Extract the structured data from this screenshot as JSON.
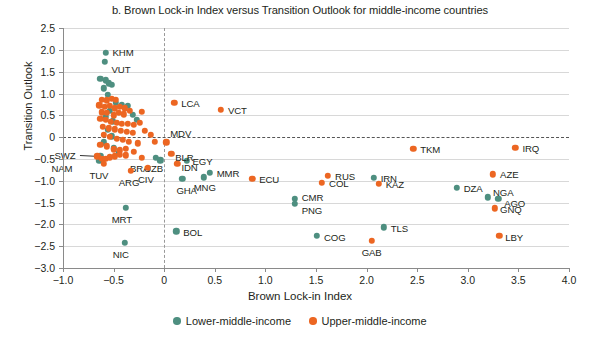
{
  "chart_data": {
    "type": "scatter",
    "title": "b. Brown Lock-in Index versus Transition Outlook for middle-income countries",
    "xlabel": "Brown Lock-in Index",
    "ylabel": "Transition Outlook",
    "xlim": [
      -1.0,
      4.0
    ],
    "ylim": [
      -3.0,
      2.5
    ],
    "xticks": [
      "-1.0",
      "-0.5",
      "0",
      "0.5",
      "1.0",
      "1.5",
      "2.0",
      "2.5",
      "3.0",
      "3.5",
      "4.0"
    ],
    "xtick_values": [
      -1.0,
      -0.5,
      0,
      0.5,
      1.0,
      1.5,
      2.0,
      2.5,
      3.0,
      3.5,
      4.0
    ],
    "yticks": [
      "2.5",
      "2.0",
      "1.5",
      "1.0",
      "0.5",
      "0",
      "-0.5",
      "-1.0",
      "-1.5",
      "-2.0",
      "-2.5",
      "-3.0"
    ],
    "ytick_values": [
      2.5,
      2.0,
      1.5,
      1.0,
      0.5,
      0,
      -0.5,
      -1.0,
      -1.5,
      -2.0,
      -2.5,
      -3.0
    ],
    "grid": "horizontal",
    "reference_lines": [
      {
        "axis": "y",
        "value": 0,
        "style": "dashed"
      },
      {
        "axis": "x",
        "value": 0,
        "style": "dashed"
      }
    ],
    "legend_position": "bottom",
    "colors": {
      "lower_middle_income": "#4e8f80",
      "upper_middle_income": "#ec6622"
    },
    "series": [
      {
        "name": "Lower-middle-income",
        "color": "#4e8f80",
        "points": [
          {
            "label": "KHM",
            "x": -0.58,
            "y": 1.93,
            "label_dx": 7,
            "label_dy": -1
          },
          {
            "label": "VUT",
            "x": -0.59,
            "y": 1.72,
            "label_dx": 7,
            "label_dy": 7
          },
          {
            "label": "",
            "x": -0.63,
            "y": 1.33
          },
          {
            "label": "",
            "x": -0.58,
            "y": 1.3
          },
          {
            "label": "",
            "x": -0.55,
            "y": 1.23
          },
          {
            "label": "",
            "x": -0.52,
            "y": 1.2
          },
          {
            "label": "",
            "x": -0.6,
            "y": 1.12
          },
          {
            "label": "",
            "x": -0.56,
            "y": 0.97
          },
          {
            "label": "",
            "x": -0.48,
            "y": 0.78
          },
          {
            "label": "",
            "x": -0.42,
            "y": 0.74
          },
          {
            "label": "",
            "x": -0.36,
            "y": 0.72
          },
          {
            "label": "",
            "x": -0.54,
            "y": 0.6
          },
          {
            "label": "",
            "x": -0.58,
            "y": 0.46
          },
          {
            "label": "",
            "x": -0.51,
            "y": 0.36
          },
          {
            "label": "",
            "x": -0.31,
            "y": 0.51
          },
          {
            "label": "",
            "x": -0.27,
            "y": 0.4
          },
          {
            "label": "",
            "x": -0.56,
            "y": 0.16
          },
          {
            "label": "",
            "x": -0.52,
            "y": 0.02
          },
          {
            "label": "",
            "x": -0.6,
            "y": -0.12
          },
          {
            "label": "",
            "x": -0.5,
            "y": -0.26
          },
          {
            "label": "",
            "x": -0.45,
            "y": -0.36
          },
          {
            "label": "SWZ",
            "x": -0.63,
            "y": -0.44,
            "label_dx": -46,
            "label_dy": -1,
            "leader": true
          },
          {
            "label": "NAM",
            "x": -0.64,
            "y": -0.55,
            "label_dx": -48,
            "label_dy": 7,
            "leader": false
          },
          {
            "label": "",
            "x": -0.08,
            "y": -0.47
          },
          {
            "label": "UZB",
            "x": -0.04,
            "y": -0.53,
            "label_dx": -16,
            "label_dy": 8
          },
          {
            "label": "EGY",
            "x": 0.22,
            "y": -0.55,
            "label_dx": 6,
            "label_dy": 0
          },
          {
            "label": "MMR",
            "x": 0.45,
            "y": -0.82,
            "label_dx": 7,
            "label_dy": 0
          },
          {
            "label": "MNG",
            "x": 0.39,
            "y": -0.92,
            "label_dx": -10,
            "label_dy": 10
          },
          {
            "label": "GHA",
            "x": 0.18,
            "y": -0.95,
            "label_dx": -6,
            "label_dy": 11
          },
          {
            "label": "CMR",
            "x": 1.29,
            "y": -1.42,
            "label_dx": 7,
            "label_dy": -2
          },
          {
            "label": "PNG",
            "x": 1.29,
            "y": -1.53,
            "label_dx": 7,
            "label_dy": 6
          },
          {
            "label": "IRN",
            "x": 2.07,
            "y": -0.93,
            "label_dx": 7,
            "label_dy": 0
          },
          {
            "label": "DZA",
            "x": 2.89,
            "y": -1.17,
            "label_dx": 7,
            "label_dy": 0
          },
          {
            "label": "NGA",
            "x": 3.2,
            "y": -1.38,
            "label_dx": 5,
            "label_dy": -5
          },
          {
            "label": "AGO",
            "x": 3.3,
            "y": -1.42,
            "label_dx": 6,
            "label_dy": 4
          },
          {
            "label": "MRT",
            "x": -0.38,
            "y": -1.62,
            "label_dx": -14,
            "label_dy": 11
          },
          {
            "label": "NIC",
            "x": -0.39,
            "y": -2.43,
            "label_dx": -12,
            "label_dy": 11
          },
          {
            "label": "BOL",
            "x": 0.12,
            "y": -2.16,
            "label_dx": 7,
            "label_dy": 1
          },
          {
            "label": "COG",
            "x": 1.51,
            "y": -2.27,
            "label_dx": 7,
            "label_dy": 1
          },
          {
            "label": "TLS",
            "x": 2.17,
            "y": -2.07,
            "label_dx": 7,
            "label_dy": 1
          }
        ]
      },
      {
        "name": "Upper-middle-income",
        "color": "#ec6622",
        "points": [
          {
            "label": "",
            "x": -0.62,
            "y": 0.86
          },
          {
            "label": "",
            "x": -0.57,
            "y": 0.84
          },
          {
            "label": "",
            "x": -0.52,
            "y": 0.88
          },
          {
            "label": "",
            "x": -0.48,
            "y": 0.86
          },
          {
            "label": "",
            "x": -0.64,
            "y": 0.73
          },
          {
            "label": "",
            "x": -0.59,
            "y": 0.7
          },
          {
            "label": "",
            "x": -0.54,
            "y": 0.72
          },
          {
            "label": "",
            "x": -0.49,
            "y": 0.66
          },
          {
            "label": "",
            "x": -0.44,
            "y": 0.7
          },
          {
            "label": "",
            "x": -0.39,
            "y": 0.66
          },
          {
            "label": "",
            "x": -0.62,
            "y": 0.57
          },
          {
            "label": "",
            "x": -0.57,
            "y": 0.55
          },
          {
            "label": "",
            "x": -0.5,
            "y": 0.5
          },
          {
            "label": "",
            "x": -0.45,
            "y": 0.55
          },
          {
            "label": "",
            "x": -0.4,
            "y": 0.52
          },
          {
            "label": "",
            "x": -0.34,
            "y": 0.6
          },
          {
            "label": "",
            "x": -0.22,
            "y": 0.58
          },
          {
            "label": "LCA",
            "x": 0.1,
            "y": 0.78,
            "label_dx": 7,
            "label_dy": 0
          },
          {
            "label": "VCT",
            "x": 0.56,
            "y": 0.62,
            "label_dx": 7,
            "label_dy": 0
          },
          {
            "label": "",
            "x": -0.63,
            "y": 0.42
          },
          {
            "label": "",
            "x": -0.58,
            "y": 0.39
          },
          {
            "label": "",
            "x": -0.53,
            "y": 0.35
          },
          {
            "label": "",
            "x": -0.47,
            "y": 0.33
          },
          {
            "label": "",
            "x": -0.42,
            "y": 0.3
          },
          {
            "label": "",
            "x": -0.36,
            "y": 0.3
          },
          {
            "label": "",
            "x": -0.3,
            "y": 0.28
          },
          {
            "label": "",
            "x": -0.24,
            "y": 0.32
          },
          {
            "label": "",
            "x": -0.61,
            "y": 0.23
          },
          {
            "label": "",
            "x": -0.55,
            "y": 0.2
          },
          {
            "label": "",
            "x": -0.49,
            "y": 0.18
          },
          {
            "label": "",
            "x": -0.43,
            "y": 0.14
          },
          {
            "label": "",
            "x": -0.37,
            "y": 0.12
          },
          {
            "label": "",
            "x": -0.31,
            "y": 0.1
          },
          {
            "label": "",
            "x": -0.19,
            "y": 0.14
          },
          {
            "label": "",
            "x": -0.13,
            "y": 0.05
          },
          {
            "label": "",
            "x": -0.6,
            "y": 0.05
          },
          {
            "label": "",
            "x": -0.54,
            "y": 0.0
          },
          {
            "label": "",
            "x": -0.47,
            "y": -0.04
          },
          {
            "label": "",
            "x": -0.41,
            "y": -0.06
          },
          {
            "label": "",
            "x": -0.35,
            "y": -0.1
          },
          {
            "label": "",
            "x": -0.26,
            "y": -0.14
          },
          {
            "label": "",
            "x": -0.09,
            "y": -0.1
          },
          {
            "label": "MDV",
            "x": 0.02,
            "y": -0.12,
            "label_dx": 4,
            "label_dy": -9
          },
          {
            "label": "",
            "x": -0.63,
            "y": -0.17
          },
          {
            "label": "",
            "x": -0.57,
            "y": -0.21
          },
          {
            "label": "",
            "x": -0.5,
            "y": -0.28
          },
          {
            "label": "",
            "x": -0.44,
            "y": -0.3
          },
          {
            "label": "",
            "x": -0.38,
            "y": -0.27
          },
          {
            "label": "",
            "x": -0.3,
            "y": -0.33
          },
          {
            "label": "BLR",
            "x": 0.07,
            "y": -0.38,
            "label_dx": 4,
            "label_dy": 3
          },
          {
            "label": "IDN",
            "x": 0.13,
            "y": -0.62,
            "label_dx": 4,
            "label_dy": 3
          },
          {
            "label": "",
            "x": -0.66,
            "y": -0.44
          },
          {
            "label": "",
            "x": -0.62,
            "y": -0.5
          },
          {
            "label": "",
            "x": -0.58,
            "y": -0.5
          },
          {
            "label": "",
            "x": -0.54,
            "y": -0.46
          },
          {
            "label": "",
            "x": -0.49,
            "y": -0.44
          },
          {
            "label": "",
            "x": -0.44,
            "y": -0.4
          },
          {
            "label": "",
            "x": -0.38,
            "y": -0.42
          },
          {
            "label": "BRA",
            "x": -0.22,
            "y": -0.48,
            "label_dx": -12,
            "label_dy": 10
          },
          {
            "label": "TUV",
            "x": -0.6,
            "y": -0.62,
            "label_dx": -14,
            "label_dy": 11
          },
          {
            "label": "ARG",
            "x": -0.33,
            "y": -0.77,
            "label_dx": -12,
            "label_dy": 11
          },
          {
            "label": "CIV",
            "x": -0.16,
            "y": -0.7,
            "label_dx": -10,
            "label_dy": 11
          },
          {
            "label": "ECU",
            "x": 0.87,
            "y": -0.95,
            "label_dx": 7,
            "label_dy": 0
          },
          {
            "label": "RUS",
            "x": 1.62,
            "y": -0.88,
            "label_dx": 7,
            "label_dy": 0
          },
          {
            "label": "COL",
            "x": 1.56,
            "y": -1.05,
            "label_dx": 7,
            "label_dy": 0
          },
          {
            "label": "KAZ",
            "x": 2.12,
            "y": -1.07,
            "label_dx": 7,
            "label_dy": 0
          },
          {
            "label": "TKM",
            "x": 2.46,
            "y": -0.27,
            "label_dx": 7,
            "label_dy": 0
          },
          {
            "label": "IRQ",
            "x": 3.47,
            "y": -0.25,
            "label_dx": 7,
            "label_dy": 0
          },
          {
            "label": "AZE",
            "x": 3.25,
            "y": -0.85,
            "label_dx": 7,
            "label_dy": 0
          },
          {
            "label": "GNQ",
            "x": 3.27,
            "y": -1.63,
            "label_dx": 5,
            "label_dy": 1
          },
          {
            "label": "LBY",
            "x": 3.31,
            "y": -2.26,
            "label_dx": 6,
            "label_dy": 1
          },
          {
            "label": "GAB",
            "x": 2.05,
            "y": -2.38,
            "label_dx": -10,
            "label_dy": 11
          }
        ]
      }
    ]
  },
  "legend": {
    "items": [
      {
        "label": "Lower-middle-income",
        "color": "#4e8f80"
      },
      {
        "label": "Upper-middle-income",
        "color": "#ec6622"
      }
    ]
  }
}
